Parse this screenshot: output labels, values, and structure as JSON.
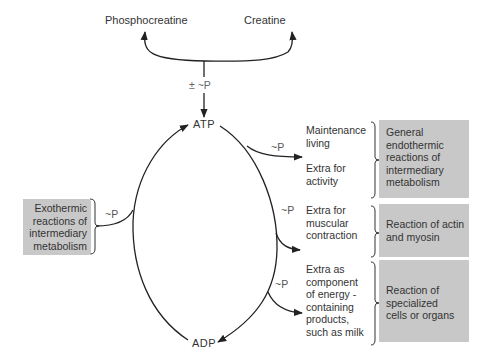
{
  "top": {
    "left_product": "Phosphocreatine",
    "right_product": "Creatine",
    "exchange_label": "± ~P"
  },
  "cycle": {
    "top_node": "ATP",
    "bottom_node": "ADP"
  },
  "input": {
    "box_lines": [
      "Exothermic",
      "reactions of",
      "intermediary",
      "metabolism"
    ],
    "p_label": "~P"
  },
  "outputs": [
    {
      "p_label": "~P",
      "uses": [
        "Maintenance",
        "living",
        "",
        "Extra for",
        "activity"
      ],
      "box_lines": [
        "General",
        "endothermic",
        "reactions of",
        "intermediary",
        "metabolism"
      ]
    },
    {
      "p_label": "~P",
      "uses": [
        "Extra for",
        "muscular",
        "contraction"
      ],
      "box_lines": [
        "Reaction of actin",
        "and myosin"
      ]
    },
    {
      "p_label": "~P",
      "uses": [
        "Extra as",
        "component",
        "of energy -",
        "containing",
        "products,",
        "such as milk"
      ],
      "box_lines": [
        "Reaction of",
        "specialized",
        "cells or organs"
      ]
    }
  ],
  "colors": {
    "box_fill": "#c8c8c8",
    "line": "#222222",
    "text": "#333333"
  }
}
